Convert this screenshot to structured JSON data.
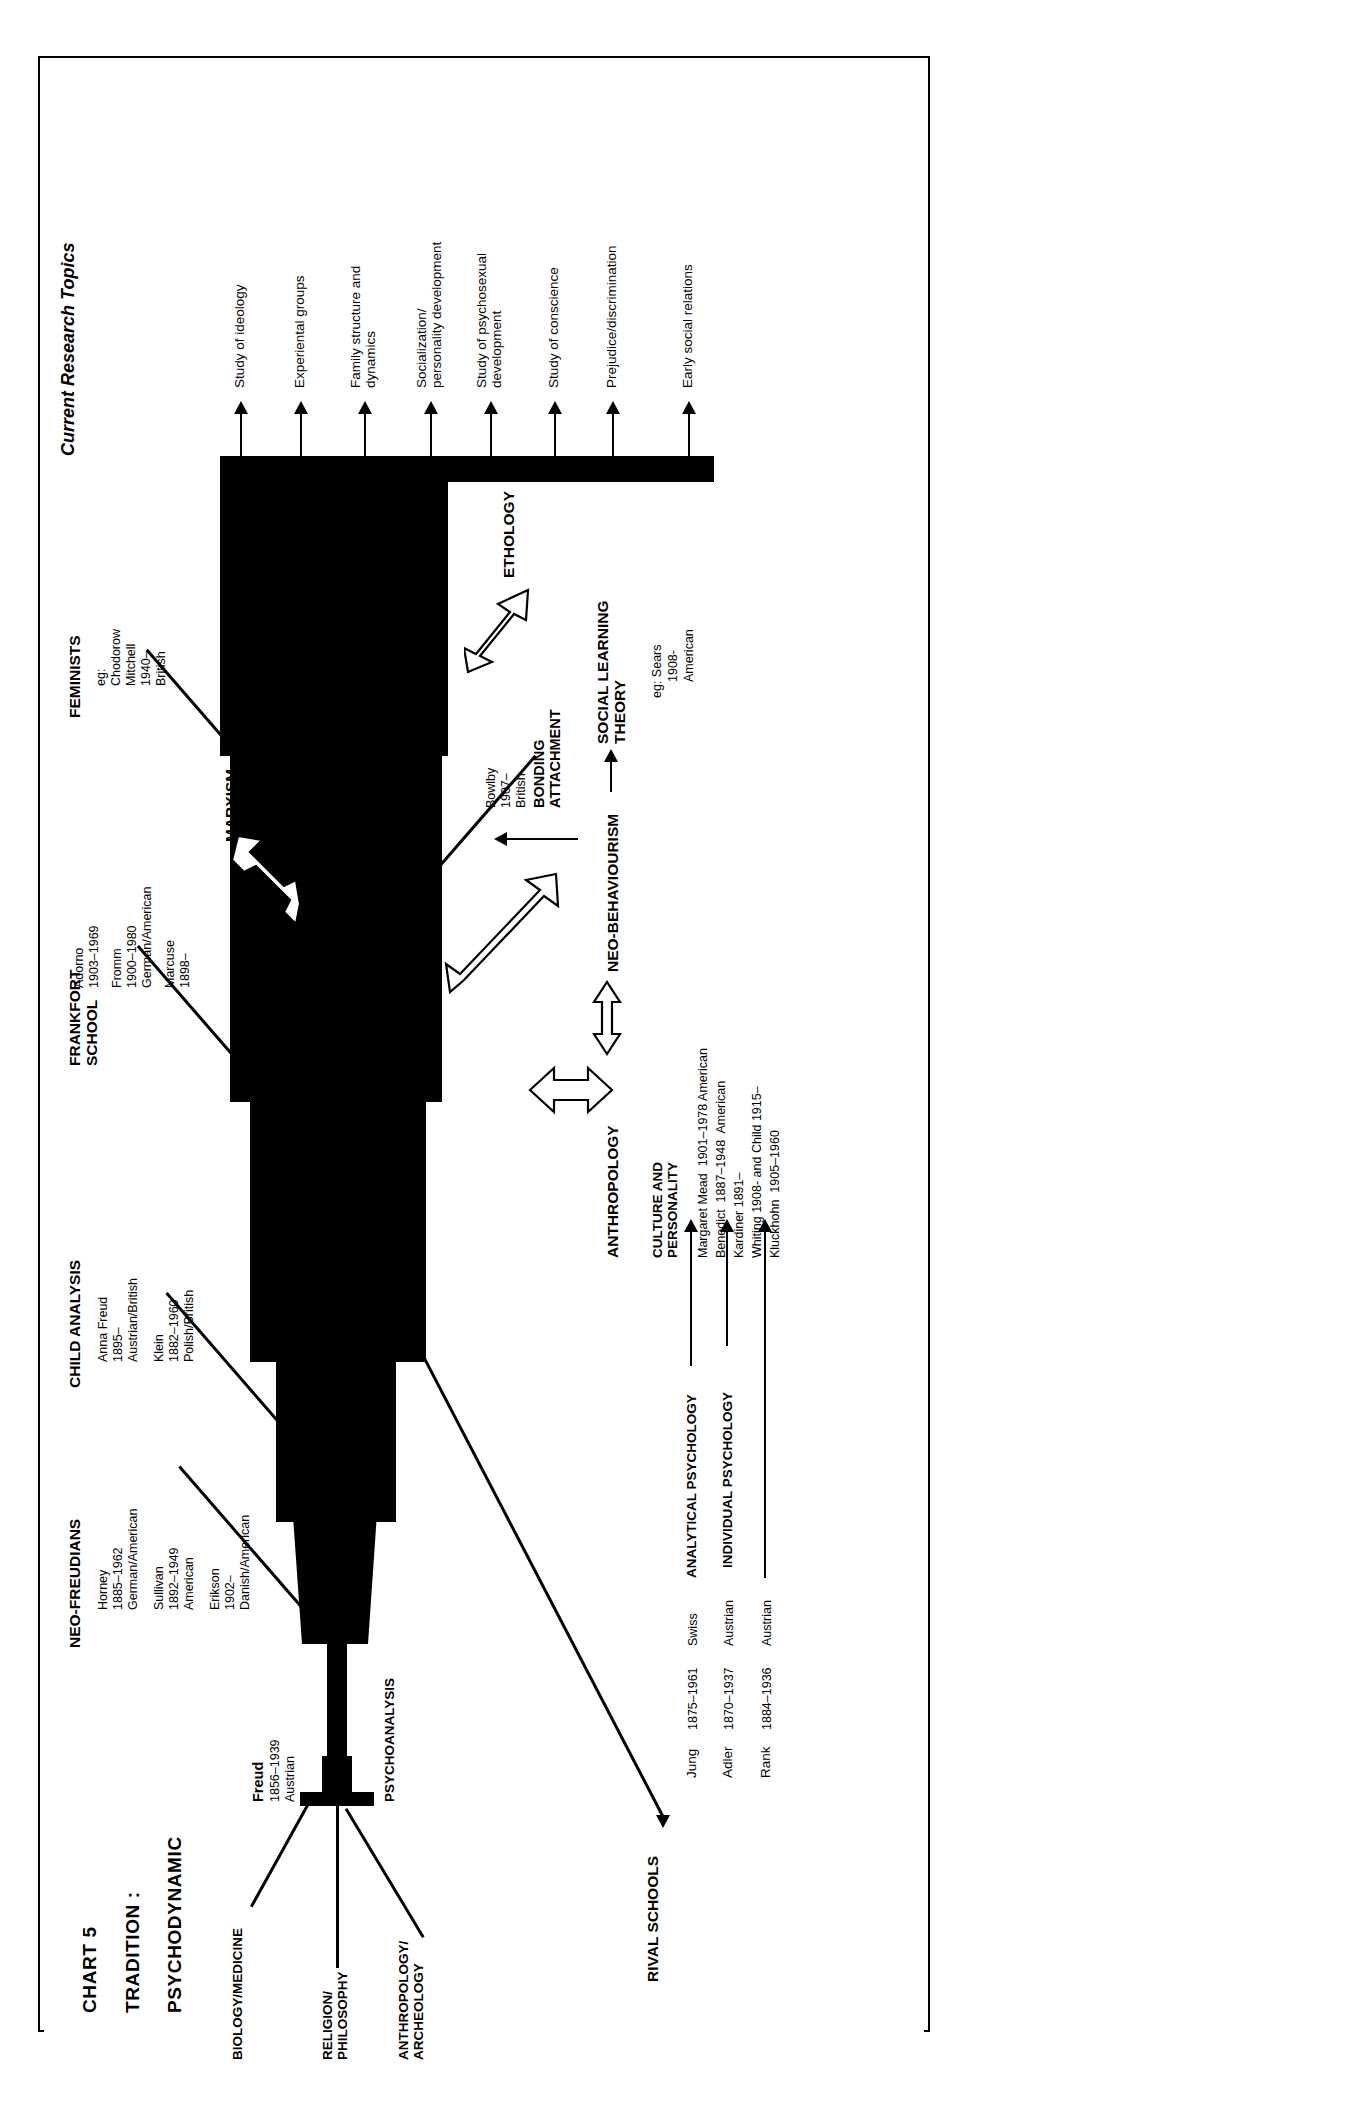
{
  "chart_id": "CHART 5",
  "title_parts": {
    "chart": "CHART 5",
    "label": "TRADITION :",
    "value": "PSYCHODYNAMIC"
  },
  "roots": [
    {
      "id": "biology",
      "label": "BIOLOGY/MEDICINE"
    },
    {
      "id": "religion",
      "label": "RELIGION/\nPHILOSOPHY"
    },
    {
      "id": "anthropology",
      "label": "ANTHROPOLOGY/\nARCHEOLOGY"
    }
  ],
  "trunk": {
    "founder": "Freud",
    "dates": "1856–1939",
    "nationality": "Austrian",
    "school": "PSYCHOANALYSIS"
  },
  "branches": [
    {
      "id": "neo-freudians",
      "heading": "NEO-FREUDIANS",
      "people": [
        {
          "name": "Horney",
          "dates": "1885–1962",
          "nationality": "German/American"
        },
        {
          "name": "Sullivan",
          "dates": "1892–1949",
          "nationality": "American"
        },
        {
          "name": "Erikson",
          "dates": "1902–",
          "nationality": "Danish/American"
        }
      ]
    },
    {
      "id": "child-analysis",
      "heading": "CHILD ANALYSIS",
      "people": [
        {
          "name": "Anna Freud",
          "dates": "1895–",
          "nationality": "Austrian/British"
        },
        {
          "name": "Klein",
          "dates": "1882–1960",
          "nationality": "Polish/British"
        }
      ]
    },
    {
      "id": "frankfort-school",
      "heading": "FRANKFORT\nSCHOOL",
      "people": [
        {
          "name": "Adorno",
          "dates": "1903–1969",
          "nationality": ""
        },
        {
          "name": "Fromm",
          "dates": "1900–1980",
          "nationality": "German/American"
        },
        {
          "name": "Marcuse",
          "dates": "1898–",
          "nationality": ""
        }
      ]
    },
    {
      "id": "feminists",
      "heading": "FEMINISTS",
      "people": [
        {
          "name": "eg:",
          "dates": "",
          "nationality": ""
        },
        {
          "name": "Chodorow",
          "dates": "",
          "nationality": ""
        },
        {
          "name": "Mitchell",
          "dates": "1940–",
          "nationality": "British"
        }
      ]
    },
    {
      "id": "bonding-attachment",
      "heading": "BONDING\nATTACHMENT",
      "people": [
        {
          "name": "Bowlby",
          "dates": "1907–",
          "nationality": "British"
        }
      ]
    }
  ],
  "external_links": [
    {
      "id": "marxism",
      "label": "MARXISM"
    },
    {
      "id": "ethology",
      "label": "ETHOLOGY"
    }
  ],
  "lower_section": {
    "anthropology_label": "ANTHROPOLOGY",
    "neo_behaviourism_label": "NEO-BEHAVIOURISM",
    "social_learning_label": "SOCIAL LEARNING\nTHEORY",
    "culture_heading": "CULTURE AND\nPERSONALITY",
    "culture_people": [
      "Margaret Mead  1901–1978 American",
      "Benedict  1887–1948  American",
      "Kardiner 1891–",
      "Whiting 1908- and Child 1915–",
      "Kluckhohn  1905–1960"
    ],
    "social_learning_people": [
      "eg: Sears",
      "1908-",
      "American"
    ]
  },
  "rival_schools": {
    "heading": "RIVAL SCHOOLS",
    "rows": [
      {
        "name": "Jung",
        "dates": "1875–1961",
        "nationality": "Swiss",
        "school": "ANALYTICAL PSYCHOLOGY"
      },
      {
        "name": "Adler",
        "dates": "1870–1937",
        "nationality": "Austrian",
        "school": "INDIVIDUAL PSYCHOLOGY"
      },
      {
        "name": "Rank",
        "dates": "1884–1936",
        "nationality": "Austrian",
        "school": ""
      }
    ]
  },
  "current_research": {
    "heading": "Current Research Topics",
    "topics": [
      "Study of ideology",
      "Experiental groups",
      "Family structure and\ndynamics",
      "Socialization/\npersonality development",
      "Study of psychosexual\ndevelopment",
      "Study of conscience",
      "Prejudice/discrimination",
      "Early social relations"
    ]
  },
  "colors": {
    "ink": "#000000",
    "paper": "#ffffff"
  }
}
